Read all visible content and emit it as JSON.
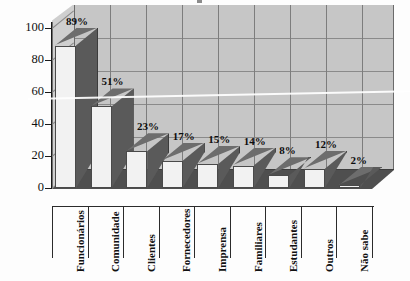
{
  "chart_data": {
    "type": "bar",
    "title": "",
    "xlabel": "",
    "ylabel": "",
    "categories": [
      "Funcionários",
      "Comunidade",
      "Clientes",
      "Fornecedores",
      "Imprensa",
      "Familiares",
      "Estudantes",
      "Outros",
      "Não sabe"
    ],
    "values": [
      89,
      51,
      23,
      17,
      15,
      14,
      8,
      12,
      2
    ],
    "data_labels": [
      "89%",
      "51%",
      "23%",
      "17%",
      "15%",
      "14%",
      "8%",
      "12%",
      "2%"
    ],
    "ylim": [
      0,
      100
    ],
    "yticks": [
      0,
      20,
      40,
      60,
      80,
      100
    ],
    "ytick_labels": [
      "0",
      "20",
      "40",
      "60",
      "80",
      "100"
    ],
    "grid": true,
    "legend": "none",
    "style": "3d-column",
    "colors": {
      "bar_front": "#f2f2f2",
      "bar_side": "#5a5a5a",
      "bar_top": "#6d6d6d",
      "back_wall": "#c6c6c6",
      "left_wall": "#cfcfcf",
      "floor": "#4f4f4f",
      "gridline": "#8a8a8a",
      "axis": "#1a1a1a",
      "text": "#111111"
    }
  }
}
